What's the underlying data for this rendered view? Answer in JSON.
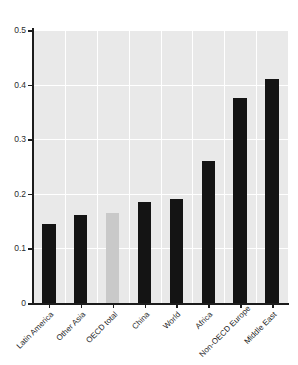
{
  "chart_data": {
    "type": "bar",
    "title": "",
    "xlabel": "",
    "ylabel": "",
    "ylim": [
      0,
      0.5
    ],
    "yticks": [
      "0",
      "0.1",
      "0.2",
      "0.3",
      "0.4",
      "0.5"
    ],
    "ytick_values": [
      0,
      0.1,
      0.2,
      0.3,
      0.4,
      0.5
    ],
    "grid": true,
    "legend": "none",
    "categories": [
      "Latin America",
      "Other Asia",
      "OECD total",
      "China",
      "World",
      "Africa",
      "Non-OECD Europe",
      "Middle East"
    ],
    "values": [
      0.145,
      0.161,
      0.165,
      0.185,
      0.19,
      0.26,
      0.375,
      0.41
    ],
    "bar_colors": [
      "#141414",
      "#141414",
      "#c9c9c9",
      "#141414",
      "#141414",
      "#141414",
      "#141414",
      "#141414"
    ],
    "highlight_category": "OECD total",
    "plot_background": "#e9e9e9",
    "gridline_color": "#ffffff",
    "axis_color": "#1c1c1c"
  }
}
